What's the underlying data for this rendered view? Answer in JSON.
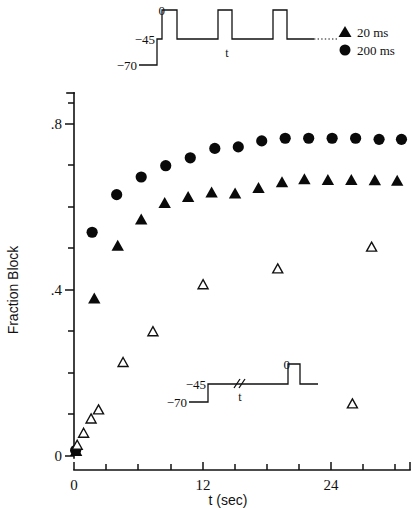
{
  "figure": {
    "background": "#ffffff",
    "ink": "#111111"
  },
  "axes": {
    "x": {
      "label": "t (sec)",
      "min": 0,
      "max": 31.5,
      "major_ticks": [
        0,
        12,
        24
      ],
      "major_tick_labels": [
        "0",
        "12",
        "24"
      ],
      "minor_ticks": [
        3,
        6,
        9,
        15,
        18,
        21,
        27,
        30
      ]
    },
    "y": {
      "label": "Fraction Block",
      "min": 0,
      "max": 0.96,
      "major_ticks": [
        0,
        0.4,
        0.8
      ],
      "major_tick_labels": [
        "0",
        ".4",
        ".8"
      ],
      "minor_ticks": [
        0.1,
        0.2,
        0.3,
        0.5,
        0.6,
        0.7,
        0.9
      ]
    }
  },
  "legend": {
    "position": "top-right",
    "entries": [
      {
        "marker": "filled-triangle",
        "label": "20 ms"
      },
      {
        "marker": "filled-circle",
        "label": "200 ms"
      }
    ]
  },
  "insets": {
    "top": {
      "name": "repetitive-pulse-protocol",
      "levels": [
        "0",
        "−45",
        "−70"
      ],
      "interval_label": "t",
      "continuation": "......"
    },
    "bottom": {
      "name": "single-pulse-recovery-protocol",
      "levels": [
        "0",
        "−45",
        "−70"
      ],
      "interval_label": "t",
      "break_symbol": "//"
    }
  },
  "chart_data": {
    "type": "scatter",
    "title": "",
    "xlabel": "t (sec)",
    "ylabel": "Fraction Block",
    "xlim": [
      0,
      31.5
    ],
    "ylim": [
      0,
      0.96
    ],
    "grid": false,
    "legend_position": "top-right",
    "series": [
      {
        "name": "200 ms",
        "marker": "filled-circle",
        "points": [
          [
            0.15,
            0.015
          ],
          [
            1.7,
            0.595
          ],
          [
            4.0,
            0.695
          ],
          [
            6.3,
            0.742
          ],
          [
            8.6,
            0.772
          ],
          [
            10.9,
            0.793
          ],
          [
            13.2,
            0.818
          ],
          [
            15.4,
            0.822
          ],
          [
            17.6,
            0.838
          ],
          [
            19.8,
            0.845
          ],
          [
            22.0,
            0.845
          ],
          [
            24.2,
            0.845
          ],
          [
            26.4,
            0.845
          ],
          [
            28.6,
            0.842
          ],
          [
            30.7,
            0.842
          ]
        ]
      },
      {
        "name": "20 ms",
        "marker": "filled-triangle",
        "points": [
          [
            0.2,
            0.012
          ],
          [
            1.9,
            0.418
          ],
          [
            4.1,
            0.558
          ],
          [
            6.3,
            0.628
          ],
          [
            8.5,
            0.672
          ],
          [
            10.7,
            0.688
          ],
          [
            12.9,
            0.7
          ],
          [
            15.1,
            0.697
          ],
          [
            17.3,
            0.712
          ],
          [
            19.5,
            0.727
          ],
          [
            21.6,
            0.735
          ],
          [
            23.8,
            0.733
          ],
          [
            26.0,
            0.733
          ],
          [
            28.2,
            0.732
          ],
          [
            30.3,
            0.731
          ]
        ]
      },
      {
        "name": "recovery",
        "marker": "open-triangle",
        "points": [
          [
            0.3,
            0.028
          ],
          [
            0.9,
            0.06
          ],
          [
            1.6,
            0.098
          ],
          [
            2.3,
            0.122
          ],
          [
            4.6,
            0.248
          ],
          [
            7.4,
            0.33
          ],
          [
            12.1,
            0.455
          ],
          [
            19.1,
            0.497
          ],
          [
            26.1,
            0.138
          ],
          [
            27.9,
            0.555
          ]
        ]
      }
    ]
  }
}
